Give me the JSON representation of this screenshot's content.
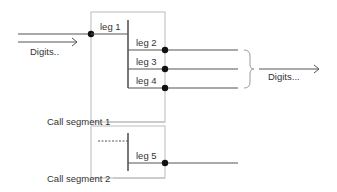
{
  "diagram": {
    "input_label": "Digits..",
    "output_label": "Digits...",
    "segments": [
      {
        "label": "Call segment 1",
        "legs": [
          "leg 1",
          "leg 2",
          "leg 3",
          "leg 4"
        ]
      },
      {
        "label": "Call segment 2",
        "legs": [
          "leg 5"
        ]
      }
    ]
  }
}
